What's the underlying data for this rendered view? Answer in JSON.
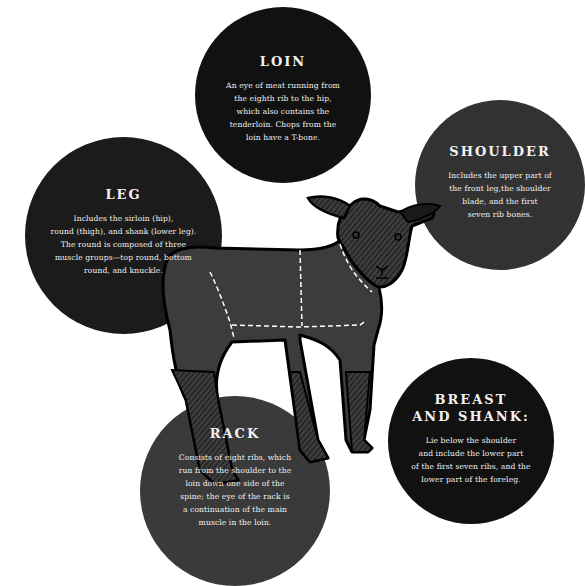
{
  "diagram": {
    "colors": {
      "background": "#ffffff",
      "circle_black": "#111111",
      "circle_dark_gray": "#323232",
      "circle_mid_gray": "#3a3a3a",
      "lamb_body": "#3c3c3c",
      "outline": "#000000",
      "text": "#f2f2f2",
      "cut_lines": "#ffffff"
    },
    "cuts": [
      {
        "id": "loin",
        "title": "LOIN",
        "description": "An eye of meat running from\nthe eighth rib to the hip,\nwhich also contains the\ntenderloin. Chops from the\nloin have a T-bone."
      },
      {
        "id": "shoulder",
        "title": "SHOULDER",
        "description": "Includes the upper part of\nthe front leg,the shoulder\nblade, and the first\nseven rib bones."
      },
      {
        "id": "leg",
        "title": "LEG",
        "description": "Includes the sirloin (hip),\nround (thigh), and shank (lower leg).\nThe round is composed of three\nmuscle groups—top round, bottom\nround, and knuckle."
      },
      {
        "id": "rack",
        "title": "RACK",
        "description": "Consists of eight ribs, which\nrun from the shoulder to the\nloin down one side of the\nspine; the eye of the rack is\na continuation of the main\nmuscle in the loin."
      },
      {
        "id": "breast-and-shank",
        "title": "BREAST\nAND SHANK:",
        "description": "Lie below the shoulder\nand include the lower part\nof the first seven ribs, and the\nlower part of the foreleg."
      }
    ]
  }
}
